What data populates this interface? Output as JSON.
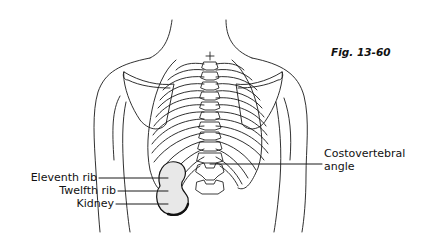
{
  "figure": {
    "caption": "Fig. 13-60"
  },
  "labels": {
    "eleventh_rib": "Eleventh rib",
    "twelfth_rib": "Twelfth rib",
    "kidney": "Kidney",
    "cva_line1": "Costovertebral",
    "cva_line2": "angle"
  },
  "colors": {
    "line": "#1a1a1a",
    "background": "#ffffff",
    "kidney_shade": "#9a9a9a"
  }
}
